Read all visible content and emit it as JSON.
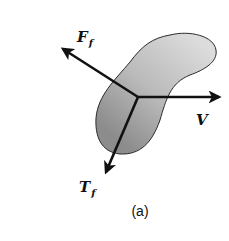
{
  "figure": {
    "caption": "(a)",
    "body": {
      "fill_light": "#d9d9d9",
      "fill_dark": "#8f8f8f",
      "stroke": "#2a2a2a"
    },
    "vectors": [
      {
        "id": "friction-force",
        "symbol": "F",
        "subscript": "f",
        "direction": "up-left"
      },
      {
        "id": "velocity",
        "symbol": "V",
        "subscript": "",
        "direction": "right"
      },
      {
        "id": "friction-torque",
        "symbol": "T",
        "subscript": "f",
        "direction": "down-left"
      }
    ],
    "arrow_color": "#111111"
  }
}
